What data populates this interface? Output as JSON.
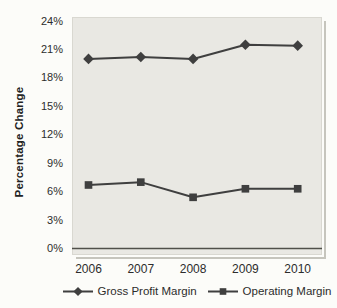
{
  "chart_data": {
    "type": "line",
    "title": "",
    "categories": [
      "2006",
      "2007",
      "2008",
      "2009",
      "2010"
    ],
    "series": [
      {
        "name": "Gross Profit Margin",
        "marker": "diamond",
        "color": "#3f3f3f",
        "values": [
          20.0,
          20.2,
          20.0,
          21.5,
          21.4
        ]
      },
      {
        "name": "Operating Margin",
        "marker": "square",
        "color": "#3f3f3f",
        "values": [
          6.7,
          7.0,
          5.4,
          6.3,
          6.3
        ]
      }
    ],
    "xlabel": "",
    "ylabel": "Percentage Change",
    "ylim": [
      0,
      24
    ],
    "ytick_step": 3,
    "ytick_labels": [
      "0%",
      "3%",
      "6%",
      "9%",
      "12%",
      "15%",
      "18%",
      "21%",
      "24%"
    ],
    "grid": false,
    "legend_position": "bottom",
    "baseline_color": "#50504a",
    "plot_bg": "#e9e8e3"
  }
}
